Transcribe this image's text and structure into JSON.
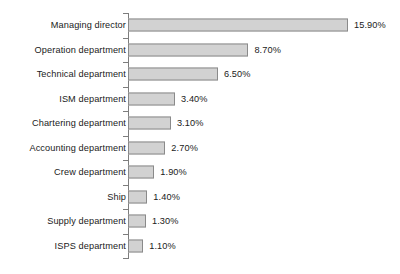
{
  "chart_data": {
    "type": "bar",
    "orientation": "horizontal",
    "title": "",
    "subtitle": "",
    "xlabel": "",
    "ylabel": "",
    "grid": false,
    "legend": false,
    "legend_position": "none",
    "axis_visible": true,
    "value_labels_shown": true,
    "value_suffix": "%",
    "xlim": [
      0,
      15.9
    ],
    "categories": [
      "Managing director",
      "Operation department",
      "Technical department",
      "ISM department",
      "Chartering department",
      "Accounting department",
      "Crew department",
      "Ship",
      "Supply department",
      "ISPS department"
    ],
    "values": [
      15.9,
      8.7,
      6.5,
      3.4,
      3.1,
      2.7,
      1.9,
      1.4,
      1.3,
      1.1
    ],
    "value_labels": [
      "15.90%",
      "8.70%",
      "6.50%",
      "3.40%",
      "3.10%",
      "2.70%",
      "1.90%",
      "1.40%",
      "1.30%",
      "1.10%"
    ],
    "colors": {
      "bar_fill": "#d2d2d2",
      "bar_stroke": "#8a8a8a",
      "axis": "#7d7d7d",
      "text": "#1a1a1a",
      "background": "#ffffff"
    }
  }
}
